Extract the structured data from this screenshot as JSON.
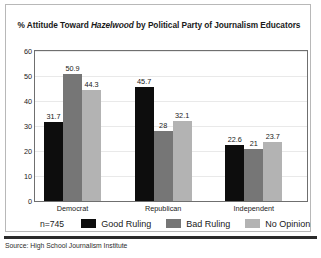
{
  "figure": {
    "title_prefix": "% Attitude Toward ",
    "title_emphasis": "Hazelwood",
    "title_suffix": " by Political Party of Journalism Educators",
    "sample_size": "n=745",
    "source": "Source: High School Journalism Institute",
    "frame_color": "#6f6f6f",
    "gridline_color": "#e9e9e9",
    "rule_color": "#2b2b2b"
  },
  "chart_data": {
    "type": "bar",
    "title": "% Attitude Toward Hazelwood by Political Party of Journalism Educators",
    "xlabel": "",
    "ylabel": "",
    "ylim": [
      0,
      60
    ],
    "yticks": [
      "0",
      "10",
      "20",
      "30",
      "40",
      "50",
      "60"
    ],
    "grid": true,
    "legend_position": "bottom-left",
    "categories": [
      "Democrat",
      "Republican",
      "Independent"
    ],
    "series": [
      {
        "name": "Good Ruling",
        "color": "#0d0d0d",
        "values": [
          31.7,
          45.7,
          22.6
        ],
        "labels": [
          "31.7",
          "45.7",
          "22.6"
        ]
      },
      {
        "name": "Bad Ruling",
        "color": "#767676",
        "values": [
          50.9,
          28,
          21
        ],
        "labels": [
          "50.9",
          "28",
          "21"
        ]
      },
      {
        "name": "No Opinion",
        "color": "#b3b3b3",
        "values": [
          44.3,
          32.1,
          23.7
        ],
        "labels": [
          "44.3",
          "32.1",
          "23.7"
        ]
      }
    ]
  }
}
